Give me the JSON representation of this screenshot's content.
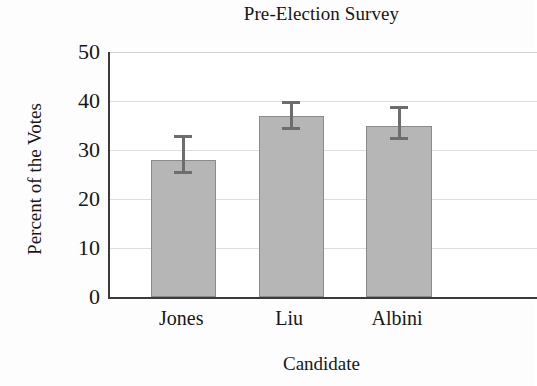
{
  "chart_data": {
    "type": "bar",
    "title": "Pre-Election Survey",
    "xlabel": "Candidate",
    "ylabel": "Percent of the Votes",
    "categories": [
      "Jones",
      "Liu",
      "Albini"
    ],
    "values": [
      28,
      37,
      35
    ],
    "error_bars": {
      "lower": [
        25,
        34,
        32
      ],
      "upper": [
        33,
        40,
        39
      ]
    },
    "ylim": [
      0,
      50
    ],
    "yticks": [
      0,
      10,
      20,
      30,
      40,
      50
    ],
    "ytick_labels": [
      "0",
      "10",
      "20",
      "30",
      "40",
      "50"
    ],
    "grid": "horizontal",
    "legend": "none",
    "colors": {
      "bar_fill": "#b6b6b6",
      "bar_border": "#8b8b8b",
      "error_bar": "#6d6d6d",
      "gridline": "#dedede",
      "axis": "#3b3b3b",
      "text": "#171717",
      "background": "#ffffff"
    }
  },
  "axis": {
    "y_tick_0": "0",
    "y_tick_1": "10",
    "y_tick_2": "20",
    "y_tick_3": "30",
    "y_tick_4": "40",
    "y_tick_5": "50",
    "x_tick_0": "Jones",
    "x_tick_1": "Liu",
    "x_tick_2": "Albini"
  }
}
